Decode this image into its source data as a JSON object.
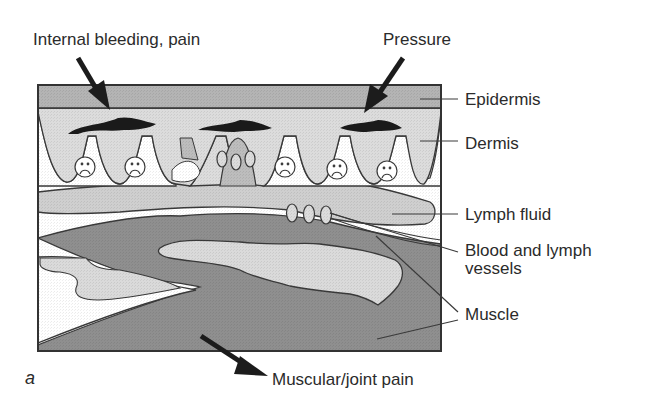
{
  "figure": {
    "panel_letter": "a",
    "top_labels": {
      "internal_bleeding": "Internal bleeding, pain",
      "pressure": "Pressure"
    },
    "right_labels": {
      "epidermis": "Epidermis",
      "dermis": "Dermis",
      "lymph_fluid": "Lymph fluid",
      "vessels_line1": "Blood and lymph",
      "vessels_line2": "vessels",
      "muscle": "Muscle"
    },
    "bottom_label": "Muscular/joint pain",
    "colors": {
      "epidermis": "#b4b4b4",
      "dermis": "#dcdcdc",
      "lymph": "#cfcfcf",
      "muscle": "#8f8f8f",
      "outline": "#3a3a3a",
      "bruise": "#1a1a1a",
      "arrow": "#1c1c1c"
    }
  }
}
